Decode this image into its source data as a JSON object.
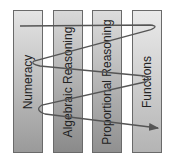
{
  "diagram": {
    "columns": [
      {
        "label": "Numeracy"
      },
      {
        "label": "Algebraic Reasoning"
      },
      {
        "label": "Proportional Reasoning"
      },
      {
        "label": "Functions"
      }
    ],
    "connector": {
      "type": "zigzag-arrow",
      "color": "#555555",
      "direction": "left-to-right, top-to-bottom"
    }
  }
}
